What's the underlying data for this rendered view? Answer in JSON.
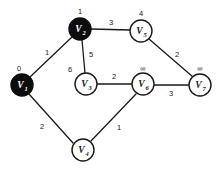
{
  "chart_data": {
    "type": "diagram",
    "diagram_kind": "weighted-undirected-graph",
    "title": "",
    "nodes": [
      {
        "id": "V1",
        "base": "V",
        "index": "1",
        "label": "V1",
        "dist": "0",
        "x": 22,
        "y": 85,
        "r": 11,
        "filled": true,
        "dist_x": 19,
        "dist_y": 68
      },
      {
        "id": "V2",
        "base": "V",
        "index": "2",
        "label": "V2",
        "dist": "1",
        "x": 80,
        "y": 29,
        "r": 11,
        "filled": true,
        "dist_x": 80,
        "dist_y": 11
      },
      {
        "id": "V3",
        "base": "V",
        "index": "3",
        "label": "V3",
        "dist": "6",
        "x": 86,
        "y": 84,
        "r": 11,
        "filled": false,
        "dist_x": 70,
        "dist_y": 69
      },
      {
        "id": "V4",
        "base": "V",
        "index": "4",
        "label": "V4",
        "dist": "",
        "x": 83,
        "y": 150,
        "r": 11,
        "filled": false,
        "dist_x": 83,
        "dist_y": 132
      },
      {
        "id": "V5",
        "base": "V",
        "index": "5",
        "label": "V5",
        "dist": "4",
        "x": 141,
        "y": 31,
        "r": 11,
        "filled": false,
        "dist_x": 141,
        "dist_y": 13
      },
      {
        "id": "V6",
        "base": "V",
        "index": "6",
        "label": "V6",
        "dist": "∞",
        "x": 143,
        "y": 84,
        "r": 11,
        "filled": false,
        "dist_x": 143,
        "dist_y": 68
      },
      {
        "id": "V7",
        "base": "V",
        "index": "7",
        "label": "V7",
        "dist": "∞",
        "x": 200,
        "y": 85,
        "r": 11,
        "filled": false,
        "dist_x": 200,
        "dist_y": 68
      }
    ],
    "edges": [
      {
        "from": "V1",
        "to": "V2",
        "weight": "1",
        "x1": 30,
        "y1": 77,
        "x2": 72,
        "y2": 37,
        "lx": 47,
        "ly": 52
      },
      {
        "from": "V1",
        "to": "V4",
        "weight": "2",
        "x1": 29,
        "y1": 94,
        "x2": 73,
        "y2": 143,
        "lx": 42,
        "ly": 126
      },
      {
        "from": "V2",
        "to": "V3",
        "weight": "5",
        "x1": 82,
        "y1": 40,
        "x2": 85,
        "y2": 73,
        "lx": 91,
        "ly": 54
      },
      {
        "from": "V2",
        "to": "V5",
        "weight": "3",
        "x1": 91,
        "y1": 29,
        "x2": 130,
        "y2": 30,
        "lx": 111,
        "ly": 22
      },
      {
        "from": "V3",
        "to": "V6",
        "weight": "2",
        "x1": 97,
        "y1": 84,
        "x2": 132,
        "y2": 84,
        "lx": 114,
        "ly": 76
      },
      {
        "from": "V4",
        "to": "V6",
        "weight": "1",
        "x1": 91,
        "y1": 141,
        "x2": 136,
        "y2": 94,
        "lx": 119,
        "ly": 127
      },
      {
        "from": "V5",
        "to": "V7",
        "weight": "2",
        "x1": 149,
        "y1": 39,
        "x2": 193,
        "y2": 77,
        "lx": 177,
        "ly": 54
      },
      {
        "from": "V6",
        "to": "V7",
        "weight": "3",
        "x1": 154,
        "y1": 85,
        "x2": 189,
        "y2": 85,
        "lx": 171,
        "ly": 93
      }
    ],
    "node_labels_extra": [
      {
        "for": "V3",
        "text": "6"
      }
    ],
    "colors": {
      "background": "#ffffff",
      "stroke": "#1a1a1a",
      "node_filled": "#0d0d0d",
      "node_open": "#ffffff",
      "text_on_filled": "#ffffff",
      "text_on_open": "#1a1a1a"
    }
  }
}
